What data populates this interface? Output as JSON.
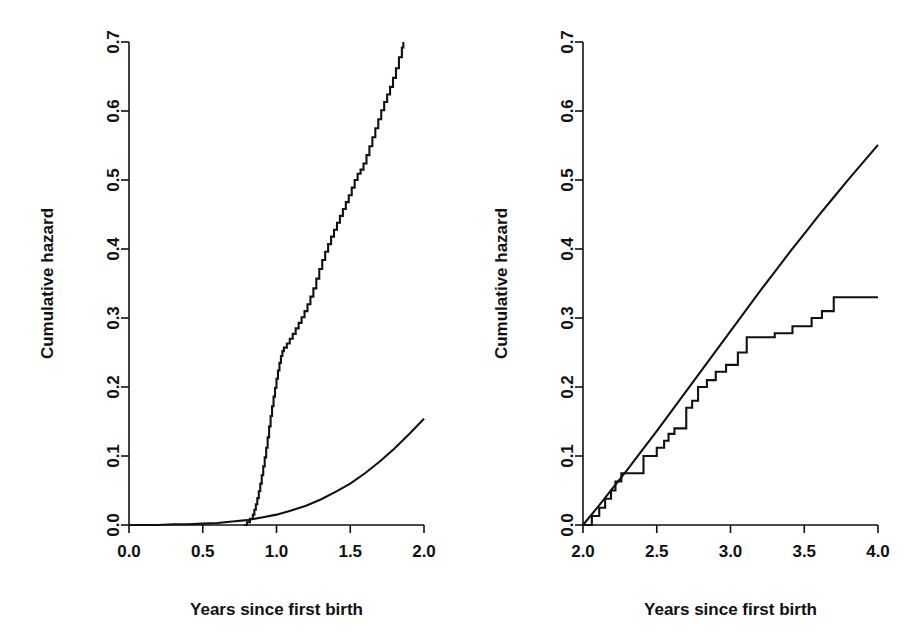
{
  "figure": {
    "background_color": "#ffffff",
    "line_color": "#111111",
    "panel_count": 2
  },
  "chart_data": [
    {
      "panel": "left",
      "type": "line",
      "title": "",
      "xlabel": "Years since first birth",
      "ylabel": "Cumulative hazard",
      "xlim": [
        0.0,
        2.0
      ],
      "ylim": [
        0.0,
        0.7
      ],
      "xticks": [
        0.0,
        0.5,
        1.0,
        1.5,
        2.0
      ],
      "xticklabels": [
        "0.0",
        "0.5",
        "1.0",
        "1.5",
        "2.0"
      ],
      "yticks": [
        0.0,
        0.1,
        0.2,
        0.3,
        0.4,
        0.5,
        0.6,
        0.7
      ],
      "yticklabels": [
        "0.0",
        "0.1",
        "0.2",
        "0.3",
        "0.4",
        "0.5",
        "0.6",
        "0.7"
      ],
      "grid": false,
      "legend": "none",
      "series": [
        {
          "name": "Nelson-Aalen estimate",
          "style": "step",
          "x": [
            0.78,
            0.8,
            0.82,
            0.84,
            0.85,
            0.86,
            0.87,
            0.88,
            0.89,
            0.9,
            0.91,
            0.92,
            0.93,
            0.94,
            0.95,
            0.96,
            0.97,
            0.98,
            0.99,
            1.0,
            1.01,
            1.02,
            1.03,
            1.04,
            1.05,
            1.07,
            1.09,
            1.11,
            1.13,
            1.15,
            1.17,
            1.19,
            1.21,
            1.23,
            1.25,
            1.27,
            1.29,
            1.31,
            1.33,
            1.35,
            1.37,
            1.39,
            1.41,
            1.43,
            1.45,
            1.47,
            1.49,
            1.51,
            1.53,
            1.55,
            1.57,
            1.59,
            1.61,
            1.63,
            1.65,
            1.67,
            1.69,
            1.71,
            1.73,
            1.75,
            1.77,
            1.79,
            1.81,
            1.83,
            1.85,
            1.86
          ],
          "y": [
            0.0,
            0.004,
            0.009,
            0.015,
            0.022,
            0.03,
            0.039,
            0.049,
            0.06,
            0.072,
            0.085,
            0.098,
            0.112,
            0.127,
            0.143,
            0.158,
            0.172,
            0.186,
            0.199,
            0.212,
            0.224,
            0.235,
            0.245,
            0.252,
            0.257,
            0.263,
            0.27,
            0.277,
            0.285,
            0.293,
            0.301,
            0.31,
            0.32,
            0.331,
            0.343,
            0.357,
            0.371,
            0.384,
            0.396,
            0.407,
            0.418,
            0.428,
            0.438,
            0.448,
            0.458,
            0.468,
            0.478,
            0.489,
            0.5,
            0.509,
            0.515,
            0.524,
            0.536,
            0.549,
            0.562,
            0.575,
            0.588,
            0.601,
            0.613,
            0.624,
            0.635,
            0.648,
            0.662,
            0.678,
            0.692,
            0.7
          ]
        },
        {
          "name": "Parametric fit",
          "style": "smooth",
          "x": [
            0.0,
            0.1,
            0.2,
            0.3,
            0.4,
            0.5,
            0.6,
            0.7,
            0.8,
            0.9,
            1.0,
            1.1,
            1.2,
            1.3,
            1.4,
            1.5,
            1.6,
            1.7,
            1.8,
            1.9,
            2.0
          ],
          "y": [
            0.0,
            0.0,
            0.0,
            0.001,
            0.001,
            0.002,
            0.003,
            0.005,
            0.007,
            0.011,
            0.015,
            0.021,
            0.028,
            0.037,
            0.048,
            0.06,
            0.075,
            0.092,
            0.111,
            0.132,
            0.154
          ]
        }
      ]
    },
    {
      "panel": "right",
      "type": "line",
      "title": "",
      "xlabel": "Years since first birth",
      "ylabel": "Cumulative hazard",
      "xlim": [
        2.0,
        4.0
      ],
      "ylim": [
        0.0,
        0.7
      ],
      "xticks": [
        2.0,
        2.5,
        3.0,
        3.5,
        4.0
      ],
      "xticklabels": [
        "2.0",
        "2.5",
        "3.0",
        "3.5",
        "4.0"
      ],
      "yticks": [
        0.0,
        0.1,
        0.2,
        0.3,
        0.4,
        0.5,
        0.6,
        0.7
      ],
      "yticklabels": [
        "0.0",
        "0.1",
        "0.2",
        "0.3",
        "0.4",
        "0.5",
        "0.6",
        "0.7"
      ],
      "grid": false,
      "legend": "none",
      "series": [
        {
          "name": "Nelson-Aalen estimate",
          "style": "step",
          "x": [
            2.0,
            2.06,
            2.11,
            2.15,
            2.19,
            2.22,
            2.26,
            2.41,
            2.5,
            2.55,
            2.58,
            2.62,
            2.7,
            2.74,
            2.78,
            2.84,
            2.9,
            2.97,
            3.05,
            3.11,
            3.3,
            3.42,
            3.55,
            3.62,
            3.7,
            4.0
          ],
          "y": [
            0.0,
            0.013,
            0.025,
            0.038,
            0.05,
            0.063,
            0.075,
            0.1,
            0.112,
            0.122,
            0.132,
            0.14,
            0.17,
            0.18,
            0.2,
            0.21,
            0.222,
            0.232,
            0.25,
            0.272,
            0.278,
            0.288,
            0.3,
            0.31,
            0.33,
            0.33
          ]
        },
        {
          "name": "Parametric fit",
          "style": "smooth",
          "x": [
            2.0,
            2.1,
            2.2,
            2.3,
            2.4,
            2.5,
            2.6,
            2.7,
            2.8,
            2.9,
            3.0,
            3.1,
            3.2,
            3.3,
            3.4,
            3.5,
            3.6,
            3.7,
            3.8,
            3.9,
            4.0
          ],
          "y": [
            0.0,
            0.026,
            0.053,
            0.08,
            0.108,
            0.136,
            0.165,
            0.194,
            0.223,
            0.252,
            0.281,
            0.31,
            0.339,
            0.367,
            0.395,
            0.422,
            0.449,
            0.475,
            0.501,
            0.526,
            0.551
          ]
        }
      ]
    }
  ]
}
